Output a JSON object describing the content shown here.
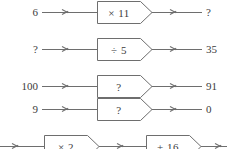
{
  "page": {
    "background_color": "#ffffff",
    "ink_color": "#3b3b3b",
    "line_color": "#6e6e6e"
  },
  "rows": [
    {
      "id": "row-1",
      "input": "6",
      "operation": "× 11",
      "output": "?"
    },
    {
      "id": "row-2",
      "input": "?",
      "operation": "÷ 5",
      "output": "35"
    },
    {
      "id": "row-3",
      "input": "100",
      "operation": "?",
      "output": "91"
    },
    {
      "id": "row-4",
      "input": "9",
      "operation": "?",
      "output": "0"
    }
  ],
  "bottom_row": {
    "id": "row-5-clipped",
    "operations": [
      "× 2",
      "+ 16"
    ]
  }
}
